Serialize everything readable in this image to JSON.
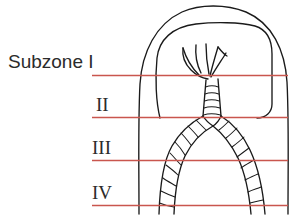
{
  "figure": {
    "width": 301,
    "height": 216,
    "background_color": "#ffffff"
  },
  "colors": {
    "zone_line": "#c9564e",
    "outline": "#1a1a1a",
    "text": "#2b2b2b",
    "background": "#ffffff"
  },
  "labels": {
    "subzone_1": "Subzone I",
    "subzone_2": "II",
    "subzone_3": "III",
    "subzone_4": "IV"
  },
  "zone_lines": [
    {
      "name": "subzone-I-line",
      "label": "Subzone I",
      "y": 75,
      "x1": 92,
      "x2": 288
    },
    {
      "name": "subzone-II-line",
      "label": "II",
      "y": 117,
      "x1": 92,
      "x2": 288
    },
    {
      "name": "subzone-III-line",
      "label": "III",
      "y": 160,
      "x1": 92,
      "x2": 288
    },
    {
      "name": "subzone-IV-line",
      "label": "IV",
      "y": 205,
      "x1": 92,
      "x2": 288
    }
  ],
  "anatomy": {
    "outer_dome": "outer-dome-outline",
    "inner_chamber": "inner-chamber-outline",
    "crown": "branching-crown",
    "trunk": "segmented-trunk",
    "left_branch": "segmented-left-branch",
    "right_branch": "segmented-right-branch"
  }
}
